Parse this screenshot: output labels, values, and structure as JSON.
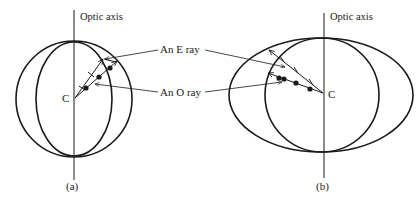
{
  "figure": {
    "panel_a": {
      "axis_label": "Optic axis",
      "center_label": "C",
      "caption": "(a)"
    },
    "panel_b": {
      "axis_label": "Optic axis",
      "center_label": "C",
      "caption": "(b)"
    },
    "callouts": {
      "e_ray": "An E ray",
      "o_ray": "An O ray"
    },
    "colors": {
      "ink": "#1a1a1a",
      "background": "#ffffff"
    }
  }
}
